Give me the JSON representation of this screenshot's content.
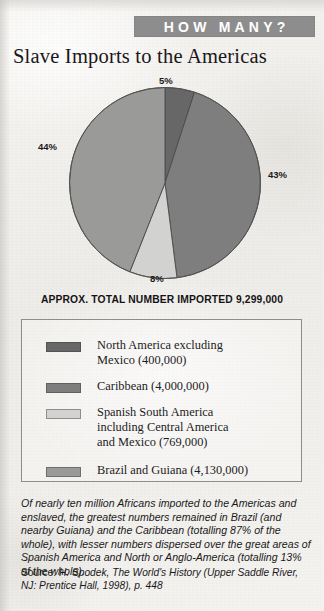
{
  "banner": {
    "label": "HOW MANY?",
    "background_color": "#8d8d8d",
    "text_color": "#ffffff"
  },
  "title": "Slave Imports to the Americas",
  "total_line": "APPROX. TOTAL NUMBER IMPORTED 9,299,000",
  "chart_data": {
    "type": "pie",
    "title": "Slave Imports to the Americas",
    "subtitle": "APPROX. TOTAL NUMBER IMPORTED 9,299,000",
    "total": 9299000,
    "total_display": "9,299,000",
    "legend_position": "below",
    "grid": false,
    "categories": [
      "North America excluding Mexico",
      "Caribbean",
      "Spanish South America including Central America and Mexico",
      "Brazil and Guiana"
    ],
    "values": [
      5,
      43,
      8,
      44
    ],
    "value_labels": [
      "5%",
      "43%",
      "8%",
      "44%"
    ],
    "counts": [
      400000,
      4000000,
      769000,
      4130000
    ],
    "count_labels": [
      "400,000",
      "4,000,000",
      "769,000",
      "4,130,000"
    ],
    "colors": [
      "#676767",
      "#7e7e7e",
      "#d2d2d0",
      "#9a9a99"
    ],
    "slices": [
      {
        "label": "5%",
        "value": 5,
        "color": "#676767",
        "start_deg": 0,
        "end_deg": 18
      },
      {
        "label": "43%",
        "value": 43,
        "color": "#7e7e7e",
        "start_deg": 18,
        "end_deg": 172.8
      },
      {
        "label": "8%",
        "value": 8,
        "color": "#d2d2d0",
        "start_deg": 172.8,
        "end_deg": 201.6
      },
      {
        "label": "44%",
        "value": 44,
        "color": "#9a9a99",
        "start_deg": 201.6,
        "end_deg": 360
      }
    ]
  },
  "legend": {
    "items": [
      {
        "color": "#676767",
        "line1": "North America excluding",
        "line2": "Mexico (400,000)",
        "line3": ""
      },
      {
        "color": "#7e7e7e",
        "line1": "Caribbean (4,000,000)",
        "line2": "",
        "line3": ""
      },
      {
        "color": "#d2d2d0",
        "line1": "Spanish South America",
        "line2": "including Central America",
        "line3": "and Mexico (769,000)"
      },
      {
        "color": "#9a9a99",
        "line1": "Brazil and Guiana (4,130,000)",
        "line2": "",
        "line3": ""
      }
    ]
  },
  "caption": "Of nearly ten million Africans imported to the Americas and enslaved, the greatest numbers remained in Brazil (and nearby Guiana) and the Caribbean (totalling 87% of the whole), with lesser numbers dispersed over the great areas of Spanish America and North or Anglo-America (totalling 13% of the whole).",
  "source": {
    "label": "Source:",
    "text": "H. Spodek, The World's History (Upper Saddle River, NJ: Prentice Hall, 1998), p. 448"
  }
}
